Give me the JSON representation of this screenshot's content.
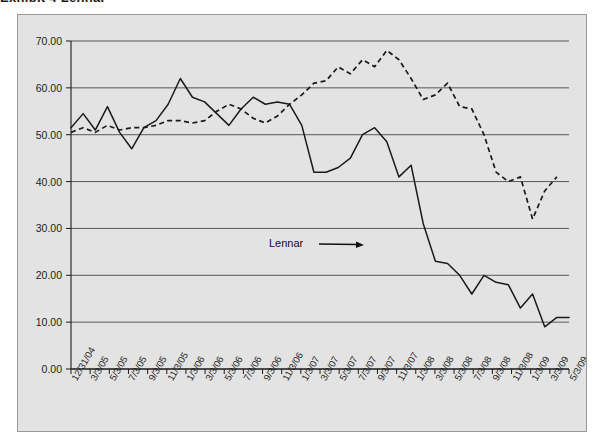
{
  "figure": {
    "title_partial": "Exhibit 4  Lennar",
    "background_color": "#e3e3e3",
    "frame_color": "#9a9a9a"
  },
  "annotation": {
    "label": "Lennar",
    "x": 268,
    "y": 236,
    "arrow_from_x": 318,
    "arrow_from_y": 243,
    "arrow_to_x": 363,
    "arrow_to_y": 244
  },
  "chart_data": {
    "type": "line",
    "title": "Exhibit 4  Lennar",
    "xlabel": "",
    "ylabel": "",
    "ylim": [
      0,
      70
    ],
    "yticks": [
      0,
      10,
      20,
      30,
      40,
      50,
      60,
      70
    ],
    "ytick_labels": [
      "0.00",
      "10.00",
      "20.00",
      "30.00",
      "40.00",
      "50.00",
      "60.00",
      "70.00"
    ],
    "grid": true,
    "grid_axis": "y",
    "legend": "none",
    "categories": [
      "12/31/04",
      "3/3/05",
      "5/3/05",
      "7/3/05",
      "9/3/05",
      "11/3/05",
      "1/3/06",
      "3/3/06",
      "5/3/06",
      "7/3/06",
      "9/3/06",
      "11/3/06",
      "1/3/07",
      "3/3/07",
      "5/3/07",
      "7/3/07",
      "9/3/07",
      "11/3/07",
      "1/3/08",
      "3/3/08",
      "5/3/08",
      "7/3/08",
      "9/3/08",
      "11/3/08",
      "1/3/09",
      "3/3/09",
      "5/3/09"
    ],
    "series": [
      {
        "name": "Lennar",
        "style": "solid",
        "color": "#1a1a1a",
        "values": [
          51.5,
          54.0,
          56.0,
          51.0,
          47.0,
          51.0,
          55.0,
          62.0,
          57.5,
          56.0,
          52.0,
          55.5,
          58.0,
          56.5,
          57.0,
          52.0,
          42.0,
          42.0,
          43.5,
          48.0,
          51.5,
          50.0,
          41.0,
          43.5,
          31.0,
          23.0,
          22.5
        ],
        "values_extended": [
          51.5,
          54.0,
          56.0,
          51.0,
          47.0,
          51.0,
          55.0,
          62.0,
          57.5,
          56.0,
          52.0,
          55.5,
          58.0,
          56.5,
          57.0,
          52.0,
          42.0,
          42.0,
          43.5,
          48.0,
          51.5,
          50.0,
          41.0,
          43.5,
          31.0,
          23.0,
          22.5,
          20.0,
          16.0,
          20.0,
          18.5,
          18.0,
          13.0,
          16.0,
          9.0,
          11.0,
          11.0
        ]
      },
      {
        "name": "Index",
        "style": "dashed",
        "color": "#1a1a1a",
        "values": [
          50.5,
          51.0,
          52.0,
          50.5,
          51.5,
          51.5,
          53.0,
          53.0,
          52.0,
          53.5,
          56.0,
          57.0,
          58.0,
          60.0,
          62.0,
          66.0,
          68.0,
          64.0,
          60.0,
          57.0,
          56.0,
          50.0,
          40.0,
          32.0,
          38.0,
          41.0,
          41.0
        ]
      }
    ]
  },
  "solid_points": [
    [
      0,
      51.5
    ],
    [
      1,
      54.5
    ],
    [
      2,
      51.0
    ],
    [
      3,
      56.0
    ],
    [
      4,
      50.5
    ],
    [
      5,
      47.0
    ],
    [
      6,
      51.5
    ],
    [
      7,
      53.0
    ],
    [
      8,
      56.5
    ],
    [
      9,
      62.0
    ],
    [
      10,
      58.0
    ],
    [
      11,
      57.0
    ],
    [
      12,
      54.5
    ],
    [
      13,
      52.0
    ],
    [
      14,
      55.5
    ],
    [
      15,
      58.0
    ],
    [
      16,
      56.5
    ],
    [
      17,
      57.0
    ],
    [
      18,
      56.5
    ],
    [
      19,
      52.0
    ],
    [
      20,
      42.0
    ],
    [
      21,
      42.0
    ],
    [
      22,
      43.0
    ],
    [
      23,
      45.0
    ],
    [
      24,
      50.0
    ],
    [
      25,
      51.5
    ],
    [
      26,
      48.5
    ],
    [
      27,
      41.0
    ],
    [
      28,
      43.5
    ],
    [
      29,
      31.0
    ],
    [
      30,
      23.0
    ],
    [
      31,
      22.5
    ],
    [
      32,
      20.0
    ],
    [
      33,
      16.0
    ],
    [
      34,
      20.0
    ],
    [
      35,
      18.5
    ],
    [
      36,
      18.0
    ],
    [
      37,
      13.0
    ],
    [
      38,
      16.0
    ],
    [
      39,
      9.0
    ],
    [
      40,
      11.0
    ],
    [
      41,
      11.0
    ]
  ],
  "dashed_points": [
    [
      0,
      50.5
    ],
    [
      1,
      51.5
    ],
    [
      2,
      50.5
    ],
    [
      3,
      52.0
    ],
    [
      4,
      51.0
    ],
    [
      5,
      51.5
    ],
    [
      6,
      51.5
    ],
    [
      7,
      52.0
    ],
    [
      8,
      53.0
    ],
    [
      9,
      53.0
    ],
    [
      10,
      52.5
    ],
    [
      11,
      53.0
    ],
    [
      12,
      55.0
    ],
    [
      13,
      56.5
    ],
    [
      14,
      55.5
    ],
    [
      15,
      53.5
    ],
    [
      16,
      52.5
    ],
    [
      17,
      54.0
    ],
    [
      18,
      56.5
    ],
    [
      19,
      58.5
    ],
    [
      20,
      61.0
    ],
    [
      21,
      61.5
    ],
    [
      22,
      64.5
    ],
    [
      23,
      63.0
    ],
    [
      24,
      66.0
    ],
    [
      25,
      64.5
    ],
    [
      26,
      68.0
    ],
    [
      27,
      66.0
    ],
    [
      28,
      62.0
    ],
    [
      29,
      57.5
    ],
    [
      30,
      58.5
    ],
    [
      31,
      61.0
    ],
    [
      32,
      56.0
    ],
    [
      33,
      55.5
    ],
    [
      34,
      50.0
    ],
    [
      35,
      42.0
    ],
    [
      36,
      40.0
    ],
    [
      37,
      41.0
    ],
    [
      38,
      32.0
    ],
    [
      39,
      38.0
    ],
    [
      40,
      41.0
    ]
  ]
}
